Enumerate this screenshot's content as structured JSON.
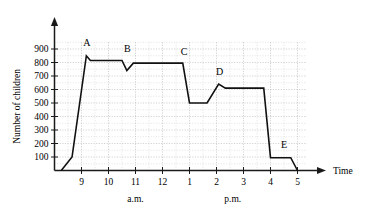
{
  "chart_data": {
    "type": "line",
    "title": "",
    "subtitle": "",
    "xlabel": "Time",
    "ylabel": "Number of children",
    "grid": true,
    "legend": "none",
    "xlim": [
      8.0,
      17.3
    ],
    "ylim": [
      0,
      950
    ],
    "y_ticks": [
      100,
      200,
      300,
      400,
      500,
      600,
      700,
      800,
      900
    ],
    "y_tick_labels": [
      "100",
      "200",
      "300",
      "400",
      "500",
      "600",
      "700",
      "800",
      "900"
    ],
    "x_ticks": [
      9,
      10,
      11,
      12,
      13,
      14,
      15,
      16,
      17
    ],
    "x_tick_labels": [
      "9",
      "10",
      "11",
      "12",
      "1",
      "2",
      "3",
      "4",
      "5"
    ],
    "period_labels": [
      {
        "text": "a.m.",
        "x": 11.0
      },
      {
        "text": "p.m.",
        "x": 14.6
      }
    ],
    "series": [
      {
        "name": "Number of children",
        "points": [
          {
            "t": 8.25,
            "v": 0
          },
          {
            "t": 8.65,
            "v": 100
          },
          {
            "t": 9.18,
            "v": 850
          },
          {
            "t": 9.33,
            "v": 815
          },
          {
            "t": 10.5,
            "v": 815
          },
          {
            "t": 10.68,
            "v": 740
          },
          {
            "t": 10.92,
            "v": 795
          },
          {
            "t": 12.75,
            "v": 795
          },
          {
            "t": 13.0,
            "v": 500
          },
          {
            "t": 13.65,
            "v": 500
          },
          {
            "t": 14.08,
            "v": 640
          },
          {
            "t": 14.33,
            "v": 610
          },
          {
            "t": 15.75,
            "v": 610
          },
          {
            "t": 16.0,
            "v": 95
          },
          {
            "t": 16.75,
            "v": 95
          },
          {
            "t": 17.0,
            "v": 0
          }
        ]
      }
    ],
    "annotations": [
      {
        "label": "A",
        "t": 9.2,
        "v": 925,
        "point_t": 9.18,
        "point_v": 850
      },
      {
        "label": "B",
        "t": 10.7,
        "v": 880,
        "point_t": 10.68,
        "point_v": 740
      },
      {
        "label": "C",
        "t": 12.8,
        "v": 855,
        "point_t": 12.75,
        "point_v": 795
      },
      {
        "label": "D",
        "t": 14.12,
        "v": 710,
        "point_t": 14.08,
        "point_v": 640
      },
      {
        "label": "E",
        "t": 16.5,
        "v": 165,
        "point_t": 16.4,
        "point_v": 95
      }
    ]
  }
}
